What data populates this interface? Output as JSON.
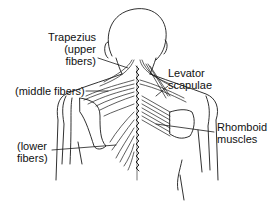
{
  "figure": {
    "line_color": "#1a1a1a",
    "background": "#ffffff"
  },
  "labels": {
    "trapezius_line1": "Trapezius",
    "trapezius_line2": "(upper",
    "trapezius_line3": "fibers)",
    "middle_fibers": "(middle fibers)",
    "lower_line1": "(lower",
    "lower_line2": "fibers)",
    "levator_line1": "Levator",
    "levator_line2": "scapulae",
    "rhomboid_line1": "Rhomboid",
    "rhomboid_line2": "muscles"
  }
}
